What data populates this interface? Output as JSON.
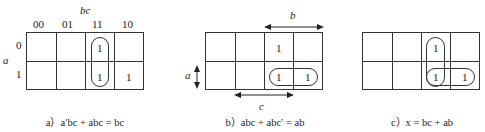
{
  "diagram": {
    "type": "karnaugh-maps",
    "maps": [
      {
        "id": "a",
        "col_var": "bc",
        "row_var": "a",
        "col_headers": [
          "00",
          "01",
          "11",
          "10"
        ],
        "row_headers": [
          "0",
          "1"
        ],
        "cells": [
          [
            "",
            "",
            "1",
            ""
          ],
          [
            "",
            "",
            "1",
            "1"
          ]
        ],
        "caption": "a）a′bc + abc = bc"
      },
      {
        "id": "b",
        "arrow_labels": {
          "top": "b",
          "left": "a",
          "bottom": "c"
        },
        "cells": [
          [
            "",
            "",
            "1",
            ""
          ],
          [
            "",
            "",
            "1",
            "1"
          ]
        ],
        "caption": "b）abc + abc′ = ab"
      },
      {
        "id": "c",
        "cells": [
          [
            "",
            "",
            "1",
            ""
          ],
          [
            "",
            "",
            "1",
            "1"
          ]
        ],
        "caption": "c）x = bc + ab"
      }
    ]
  }
}
